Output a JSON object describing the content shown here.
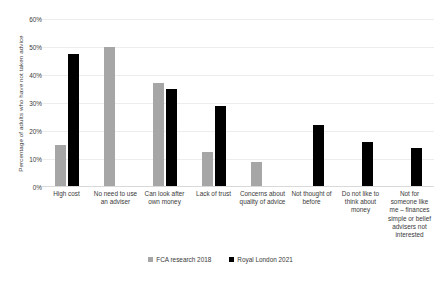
{
  "chart_data": {
    "type": "bar",
    "title": "",
    "xlabel": "",
    "ylabel": "Percentage of adults who have not taken advice",
    "ylim": [
      0,
      60
    ],
    "ytick_step": 10,
    "ytick_labels": [
      "60%",
      "50%",
      "40%",
      "30%",
      "20%",
      "10%",
      "0%"
    ],
    "ytick_values": [
      60,
      50,
      40,
      30,
      20,
      10,
      0
    ],
    "grid": true,
    "legend_position": "bottom-center",
    "categories": [
      "High cost",
      "No need to use an adviser",
      "Can look after own money",
      "Lack of trust",
      "Concerns about quality of advice",
      "Not thought of before",
      "Do not like to think about money",
      "Not for someone like me – finances simple or belief advisers not interested"
    ],
    "series": [
      {
        "name": "FCA research 2018",
        "color": "#a6a6a6",
        "values": [
          15,
          50,
          37,
          12.5,
          9,
          null,
          null,
          null
        ]
      },
      {
        "name": "Royal London 2021",
        "color": "#000000",
        "values": [
          47.5,
          null,
          35,
          29,
          null,
          22,
          16,
          14
        ]
      }
    ]
  },
  "legend": {
    "items": [
      {
        "label": "FCA research 2018",
        "swatch": "gray"
      },
      {
        "label": "Royal London 2021",
        "swatch": "black"
      }
    ]
  }
}
